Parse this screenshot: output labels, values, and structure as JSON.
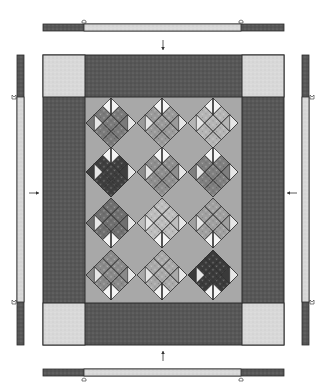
{
  "diagram": {
    "colors": {
      "background": "#ffffff",
      "border_dark": "#575757",
      "border_light": "#d9d9d9",
      "center_field": "#a8a8a8",
      "outline": "#2b2b2b",
      "arrow": "#333333"
    },
    "quilt": {
      "x": 43,
      "y": 55,
      "width": 241,
      "height": 290,
      "corner_size": 42,
      "center": {
        "x": 85,
        "y": 97,
        "width": 157,
        "height": 206
      }
    },
    "strips": {
      "top": {
        "x": 43,
        "y": 24,
        "width": 241,
        "height": 7,
        "light_from": 84,
        "light_to": 241
      },
      "bottom": {
        "x": 43,
        "y": 369,
        "width": 241,
        "height": 7,
        "light_from": 84,
        "light_to": 241
      },
      "left": {
        "x": 17,
        "y": 55,
        "width": 7,
        "height": 290,
        "light_from": 97,
        "light_to": 302
      },
      "right": {
        "x": 302,
        "y": 55,
        "width": 7,
        "height": 290,
        "light_from": 97,
        "light_to": 302
      }
    },
    "arrows": [
      {
        "name": "top-arrow",
        "direction": "down",
        "x": 163,
        "y1": 40,
        "y2": 50
      },
      {
        "name": "bottom-arrow",
        "direction": "up",
        "x": 163,
        "y1": 361,
        "y2": 351
      },
      {
        "name": "left-arrow",
        "direction": "right",
        "y": 193,
        "x1": 29,
        "x2": 39
      },
      {
        "name": "right-arrow",
        "direction": "left",
        "y": 193,
        "x1": 297,
        "x2": 287
      }
    ],
    "blocks": {
      "half_size": 25,
      "columns_x": [
        111,
        162,
        213
      ],
      "rows_y": [
        123,
        172,
        223,
        275
      ],
      "items": [
        {
          "row": 0,
          "col": 0,
          "stem": "top",
          "tone": "#7a7a7a"
        },
        {
          "row": 0,
          "col": 1,
          "stem": "top",
          "tone": "#9a9a9a"
        },
        {
          "row": 0,
          "col": 2,
          "stem": "top",
          "tone": "#b5b5b5"
        },
        {
          "row": 1,
          "col": 0,
          "stem": "top",
          "tone": "#3e3e3e"
        },
        {
          "row": 1,
          "col": 1,
          "stem": "top",
          "tone": "#8e8e8e"
        },
        {
          "row": 1,
          "col": 2,
          "stem": "top",
          "tone": "#7f7f7f"
        },
        {
          "row": 2,
          "col": 0,
          "stem": "bottom",
          "tone": "#6f6f6f"
        },
        {
          "row": 2,
          "col": 1,
          "stem": "bottom",
          "tone": "#bdbdbd"
        },
        {
          "row": 2,
          "col": 2,
          "stem": "bottom",
          "tone": "#a0a0a0"
        },
        {
          "row": 3,
          "col": 0,
          "stem": "bottom",
          "tone": "#8a8a8a"
        },
        {
          "row": 3,
          "col": 1,
          "stem": "bottom",
          "tone": "#a9a9a9"
        },
        {
          "row": 3,
          "col": 2,
          "stem": "bottom",
          "tone": "#3a3a3a"
        }
      ]
    }
  }
}
